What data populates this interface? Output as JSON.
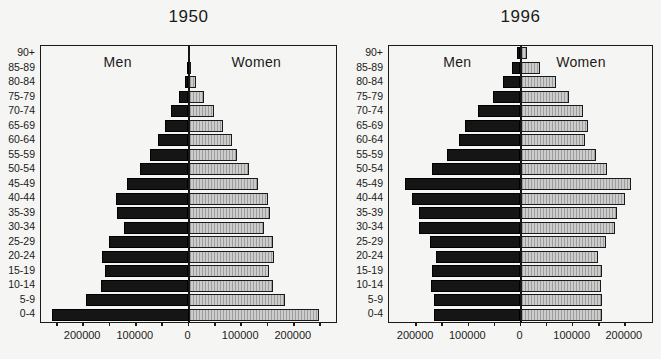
{
  "colors": {
    "background": "#f5f5f3",
    "ink": "#1a1a1a",
    "men_bar": "#151515",
    "women_bar_bg": "#cccccc",
    "women_bar_stripe": "#9d9d9d"
  },
  "axis": {
    "tick_step": 50000,
    "xtick_labels": [
      {
        "pos": -200000,
        "text": "200000"
      },
      {
        "pos": -100000,
        "text": "100000"
      },
      {
        "pos": 0,
        "text": "0"
      },
      {
        "pos": 100000,
        "text": "100000"
      },
      {
        "pos": 200000,
        "text": "200000"
      }
    ]
  },
  "chart_data": [
    {
      "type": "bar",
      "variant": "population-pyramid",
      "title": "1950",
      "men_label": "Men",
      "women_label": "Women",
      "xmax": 280000,
      "tick_max": 250000,
      "grid": false,
      "categories": [
        "90+",
        "85-89",
        "80-84",
        "75-79",
        "70-74",
        "65-69",
        "60-64",
        "55-59",
        "50-54",
        "45-49",
        "40-44",
        "35-39",
        "30-34",
        "25-29",
        "20-24",
        "15-19",
        "10-14",
        "5-9",
        "0-4"
      ],
      "series": [
        {
          "name": "Men",
          "side": "left",
          "values": [
            1000,
            3000,
            6000,
            18000,
            33000,
            45000,
            57000,
            74000,
            93000,
            116000,
            137000,
            136000,
            123000,
            150000,
            165000,
            159000,
            167000,
            195000,
            259000
          ]
        },
        {
          "name": "Women",
          "side": "right",
          "values": [
            2000,
            5000,
            15000,
            30000,
            49000,
            65000,
            83000,
            93000,
            115000,
            131000,
            150000,
            155000,
            143000,
            161000,
            162000,
            152000,
            161000,
            184000,
            247000
          ]
        }
      ]
    },
    {
      "type": "bar",
      "variant": "population-pyramid",
      "title": "1996",
      "men_label": "Men",
      "women_label": "Women",
      "xmax": 252000,
      "tick_max": 200000,
      "grid": false,
      "categories": [
        "90+",
        "85-89",
        "80-84",
        "75-79",
        "70-74",
        "65-69",
        "60-64",
        "55-59",
        "50-54",
        "45-49",
        "40-44",
        "35-39",
        "30-34",
        "25-29",
        "20-24",
        "15-19",
        "10-14",
        "5-9",
        "0-4"
      ],
      "series": [
        {
          "name": "Men",
          "side": "left",
          "values": [
            6000,
            17000,
            33000,
            52000,
            82000,
            107000,
            118000,
            141000,
            170000,
            222000,
            208000,
            195000,
            194000,
            173000,
            161000,
            170000,
            172000,
            166000,
            166000
          ]
        },
        {
          "name": "Women",
          "side": "right",
          "values": [
            12000,
            38000,
            68000,
            92000,
            119000,
            129000,
            124000,
            144000,
            165000,
            211000,
            200000,
            185000,
            182000,
            164000,
            149000,
            157000,
            154000,
            157000,
            157000
          ]
        }
      ]
    }
  ]
}
